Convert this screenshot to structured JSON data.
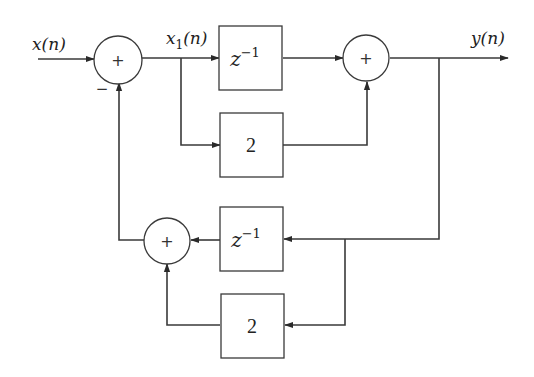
{
  "diagram": {
    "type": "block-diagram",
    "signals": {
      "input": "x(n)",
      "intermediate_base": "x",
      "intermediate_sub": "1",
      "intermediate_arg": "(n)",
      "output": "y(n)"
    },
    "blocks": {
      "forward_delay": {
        "base": "z",
        "exp": "−1"
      },
      "forward_gain": "2",
      "feedback_delay": {
        "base": "z",
        "exp": "−1"
      },
      "feedback_gain": "2"
    },
    "summers": {
      "input_sum": "+",
      "output_sum": "+",
      "feedback_sum": "+"
    },
    "input_sum_feedback_sign": "−"
  }
}
